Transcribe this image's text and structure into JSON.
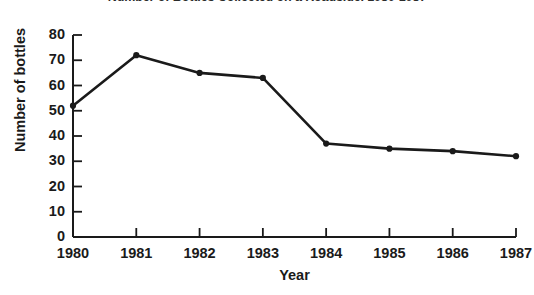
{
  "chart_data": {
    "type": "line",
    "title": "Number of Bottles Collected on a Roadside, 1980-1987",
    "xlabel": "Year",
    "ylabel": "Number of bottles",
    "categories": [
      "1980",
      "1981",
      "1982",
      "1983",
      "1984",
      "1985",
      "1986",
      "1987"
    ],
    "values": [
      52,
      72,
      65,
      63,
      37,
      35,
      34,
      32
    ],
    "series": [
      {
        "name": "Bottles collected",
        "values": [
          52,
          72,
          65,
          63,
          37,
          35,
          34,
          32
        ]
      }
    ],
    "ylim": [
      0,
      80
    ],
    "y_ticks": [
      "0",
      "10",
      "20",
      "30",
      "40",
      "50",
      "60",
      "70",
      "80"
    ],
    "x_ticks": [
      "1980",
      "1981",
      "1982",
      "1983",
      "1984",
      "1985",
      "1986",
      "1987"
    ],
    "grid": false,
    "legend": false,
    "legend_position": "none",
    "line_color": "#1a1a1a",
    "marker_color": "#1a1a1a",
    "background_color": "#ffffff"
  }
}
